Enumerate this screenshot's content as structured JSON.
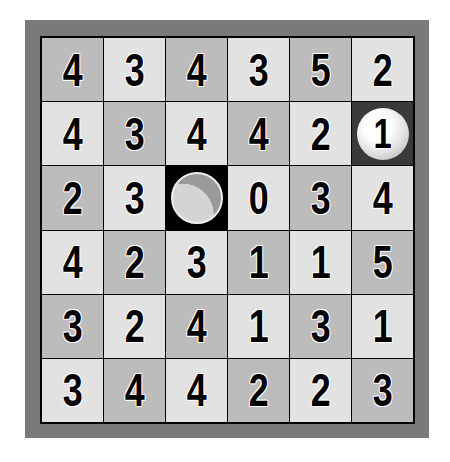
{
  "game": {
    "type": "golf-number-grid",
    "rows": 6,
    "cols": 6,
    "colors": {
      "dark_cell": "#bcbcbc",
      "light_cell": "#e2e2e2",
      "frame": "#7a7a7a",
      "grid_line": "#000000"
    },
    "ball": {
      "row": 1,
      "col": 5,
      "value": "1"
    },
    "hole": {
      "row": 2,
      "col": 2
    },
    "cells": [
      [
        "4",
        "3",
        "4",
        "3",
        "5",
        "2"
      ],
      [
        "4",
        "3",
        "4",
        "4",
        "2",
        "1"
      ],
      [
        "2",
        "3",
        "",
        "0",
        "3",
        "4"
      ],
      [
        "4",
        "2",
        "3",
        "1",
        "1",
        "5"
      ],
      [
        "3",
        "2",
        "4",
        "1",
        "3",
        "1"
      ],
      [
        "3",
        "4",
        "4",
        "2",
        "2",
        "3"
      ]
    ]
  }
}
